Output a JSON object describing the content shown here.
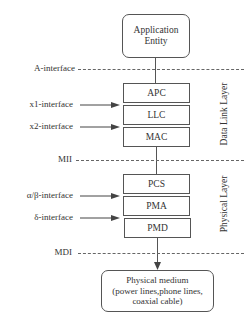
{
  "diagram": {
    "top_box": {
      "line1": "Application",
      "line2": "Entity"
    },
    "interfaces": {
      "a": "A-interface",
      "x1": "x1-interface",
      "x2": "x2-interface",
      "mii": "MII",
      "alpha_beta": "α/β-interface",
      "delta": "δ-interface",
      "mdi": "MDI"
    },
    "data_link_layer": {
      "label": "Data Link Layer",
      "blocks": [
        "APC",
        "LLC",
        "MAC"
      ]
    },
    "physical_layer": {
      "label": "Physical Layer",
      "blocks": [
        "PCS",
        "PMA",
        "PMD"
      ]
    },
    "bottom_box": {
      "line1": "Physical medium",
      "line2": "(power lines,phone lines,",
      "line3": "coaxial cable)"
    },
    "colors": {
      "line": "#555555",
      "text": "#333333",
      "background": "#ffffff"
    }
  }
}
